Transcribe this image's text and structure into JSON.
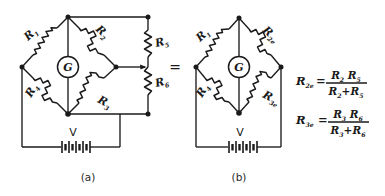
{
  "figure": {
    "background_color": "#ffffff",
    "ink_color": "#1a1a1a",
    "equals_sign": "=",
    "captions": {
      "left": "(a)",
      "right": "(b)"
    }
  },
  "circuit_a": {
    "caption": "(a)",
    "source_label": "V",
    "meter_label": "G",
    "resistor_labels": {
      "r1": "R",
      "r1_sub": "1",
      "r2": "R",
      "r2_sub": "2",
      "r3": "R",
      "r3_sub": "3",
      "r4": "R",
      "r4_sub": "4",
      "r5": "R",
      "r5_sub": "5",
      "r6": "R",
      "r6_sub": "6"
    }
  },
  "circuit_b": {
    "caption": "(b)",
    "source_label": "V",
    "meter_label": "G",
    "resistor_labels": {
      "r1": "R",
      "r1_sub": "1",
      "r2e": "R",
      "r2e_sub": "2e",
      "r3e": "R",
      "r3e_sub": "3e",
      "r4": "R",
      "r4_sub": "4"
    }
  },
  "equations": [
    {
      "lhs": "R",
      "lhs_sub": "2e",
      "equals": "=",
      "numerator": "R",
      "num_sub_a": "2",
      "numerator_b": "R",
      "num_sub_b": "5",
      "den_a": "R",
      "den_sub_a": "2",
      "den_op": "+",
      "den_b": "R",
      "den_sub_b": "5"
    },
    {
      "lhs": "R",
      "lhs_sub": "3e",
      "equals": "=",
      "numerator": "R",
      "num_sub_a": "3",
      "numerator_b": "R",
      "num_sub_b": "6",
      "den_a": "R",
      "den_sub_a": "3",
      "den_op": "+",
      "den_b": "R",
      "den_sub_b": "6"
    }
  ]
}
